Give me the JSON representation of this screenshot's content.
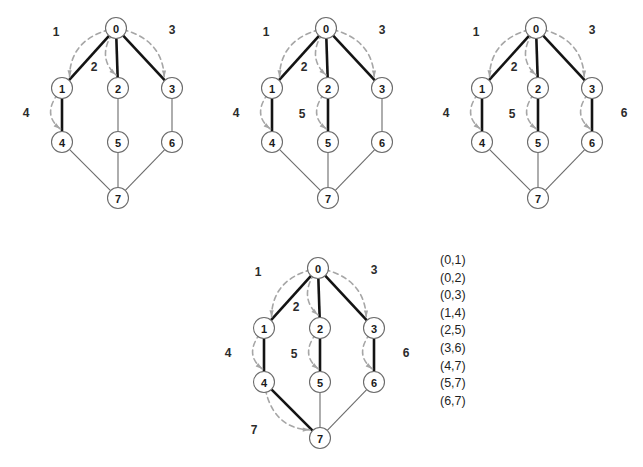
{
  "diagram": {
    "node_labels": [
      "0",
      "1",
      "2",
      "3",
      "4",
      "5",
      "6",
      "7"
    ],
    "colors": {
      "node_stroke": "#6b6b6b",
      "node_fill": "#ffffff",
      "edge_thin": "#6b6b6b",
      "edge_bold": "#141414",
      "arrow": "#a6a6a6",
      "text": "#1a1a1a",
      "background": "#ffffff"
    },
    "node_positions": [
      {
        "id": "0",
        "x": 116,
        "y": 28
      },
      {
        "id": "1",
        "x": 62,
        "y": 88
      },
      {
        "id": "2",
        "x": 118,
        "y": 88
      },
      {
        "id": "3",
        "x": 172,
        "y": 88
      },
      {
        "id": "4",
        "x": 62,
        "y": 142
      },
      {
        "id": "5",
        "x": 118,
        "y": 142
      },
      {
        "id": "6",
        "x": 172,
        "y": 142
      },
      {
        "id": "7",
        "x": 118,
        "y": 198
      }
    ],
    "graph_edges": [
      [
        "0",
        "1"
      ],
      [
        "0",
        "2"
      ],
      [
        "0",
        "3"
      ],
      [
        "1",
        "4"
      ],
      [
        "2",
        "5"
      ],
      [
        "3",
        "6"
      ],
      [
        "4",
        "7"
      ],
      [
        "5",
        "7"
      ],
      [
        "6",
        "7"
      ]
    ],
    "panels": [
      {
        "name": "panel-1",
        "origin_x": 0,
        "origin_y": 0,
        "bold_edges": [
          [
            "0",
            "1"
          ],
          [
            "0",
            "2"
          ],
          [
            "0",
            "3"
          ],
          [
            "1",
            "4"
          ]
        ],
        "arrows": [
          {
            "label": "1",
            "from": "0",
            "to": "1",
            "label_x": 56,
            "label_y": 32
          },
          {
            "label": "2",
            "from": "0",
            "to": "2",
            "label_x": 94,
            "label_y": 67
          },
          {
            "label": "3",
            "from": "0",
            "to": "3",
            "label_x": 172,
            "label_y": 30
          },
          {
            "label": "4",
            "from": "1",
            "to": "4",
            "label_x": 26,
            "label_y": 113
          }
        ]
      },
      {
        "name": "panel-2",
        "origin_x": 210,
        "origin_y": 0,
        "bold_edges": [
          [
            "0",
            "1"
          ],
          [
            "0",
            "2"
          ],
          [
            "0",
            "3"
          ],
          [
            "1",
            "4"
          ],
          [
            "2",
            "5"
          ]
        ],
        "arrows": [
          {
            "label": "1",
            "from": "0",
            "to": "1",
            "label_x": 56,
            "label_y": 32
          },
          {
            "label": "2",
            "from": "0",
            "to": "2",
            "label_x": 94,
            "label_y": 67
          },
          {
            "label": "3",
            "from": "0",
            "to": "3",
            "label_x": 172,
            "label_y": 30
          },
          {
            "label": "4",
            "from": "1",
            "to": "4",
            "label_x": 26,
            "label_y": 113
          },
          {
            "label": "5",
            "from": "2",
            "to": "5",
            "label_x": 92,
            "label_y": 114
          }
        ]
      },
      {
        "name": "panel-3",
        "origin_x": 420,
        "origin_y": 0,
        "bold_edges": [
          [
            "0",
            "1"
          ],
          [
            "0",
            "2"
          ],
          [
            "0",
            "3"
          ],
          [
            "1",
            "4"
          ],
          [
            "2",
            "5"
          ],
          [
            "3",
            "6"
          ]
        ],
        "arrows": [
          {
            "label": "1",
            "from": "0",
            "to": "1",
            "label_x": 56,
            "label_y": 32
          },
          {
            "label": "2",
            "from": "0",
            "to": "2",
            "label_x": 94,
            "label_y": 67
          },
          {
            "label": "3",
            "from": "0",
            "to": "3",
            "label_x": 172,
            "label_y": 30
          },
          {
            "label": "4",
            "from": "1",
            "to": "4",
            "label_x": 26,
            "label_y": 113
          },
          {
            "label": "5",
            "from": "2",
            "to": "5",
            "label_x": 92,
            "label_y": 114
          },
          {
            "label": "6",
            "from": "3",
            "to": "6",
            "label_x": 204,
            "label_y": 113
          }
        ]
      },
      {
        "name": "panel-4",
        "origin_x": 202,
        "origin_y": 240,
        "bold_edges": [
          [
            "0",
            "1"
          ],
          [
            "0",
            "2"
          ],
          [
            "0",
            "3"
          ],
          [
            "1",
            "4"
          ],
          [
            "2",
            "5"
          ],
          [
            "3",
            "6"
          ],
          [
            "4",
            "7"
          ]
        ],
        "arrows": [
          {
            "label": "1",
            "from": "0",
            "to": "1",
            "label_x": 56,
            "label_y": 32
          },
          {
            "label": "2",
            "from": "0",
            "to": "2",
            "label_x": 94,
            "label_y": 67
          },
          {
            "label": "3",
            "from": "0",
            "to": "3",
            "label_x": 172,
            "label_y": 30
          },
          {
            "label": "4",
            "from": "1",
            "to": "4",
            "label_x": 26,
            "label_y": 113
          },
          {
            "label": "5",
            "from": "2",
            "to": "5",
            "label_x": 92,
            "label_y": 114
          },
          {
            "label": "6",
            "from": "3",
            "to": "6",
            "label_x": 204,
            "label_y": 113
          },
          {
            "label": "7",
            "from": "4",
            "to": "7",
            "label_x": 52,
            "label_y": 190
          }
        ]
      }
    ]
  },
  "edge_list": {
    "name": "edge-list",
    "items": [
      "(0,1)",
      "(0,2)",
      "(0,3)",
      "(1,4)",
      "(2,5)",
      "(3,6)",
      "(4,7)",
      "(5,7)",
      "(6,7)"
    ]
  }
}
